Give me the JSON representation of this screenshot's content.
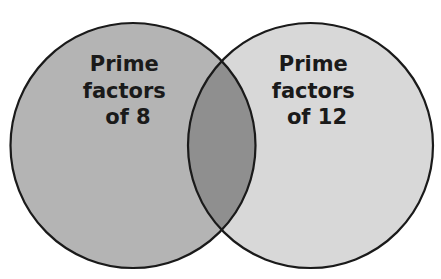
{
  "diagram": {
    "type": "venn",
    "sets": [
      {
        "id": "A",
        "label_lines": [
          "Prime",
          "factors",
          "of 8"
        ],
        "fill": "#b4b4b4"
      },
      {
        "id": "B",
        "label_lines": [
          "Prime",
          "factors",
          "of 12"
        ],
        "fill": "#d8d8d8"
      }
    ],
    "intersection": {
      "fill": "#8f8f8f"
    },
    "stroke": "#1a1a1a",
    "background": "#ffffff"
  }
}
